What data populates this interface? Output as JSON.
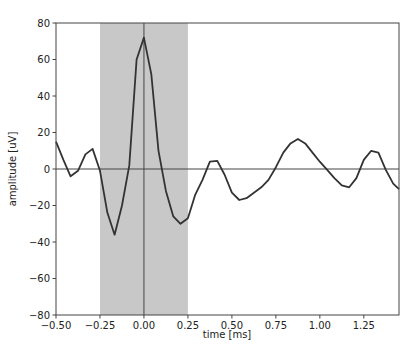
{
  "chart_data": {
    "type": "line",
    "title": "",
    "xlabel": "time [ms]",
    "ylabel": "amplitude [uV]",
    "xlim": [
      -0.5,
      1.45
    ],
    "ylim": [
      -80,
      80
    ],
    "xticks": [
      -0.5,
      -0.25,
      0.0,
      0.25,
      0.5,
      0.75,
      1.0,
      1.25
    ],
    "xtick_labels": [
      "−0.50",
      "−0.25",
      "0.00",
      "0.25",
      "0.50",
      "0.75",
      "1.00",
      "1.25"
    ],
    "yticks": [
      -80,
      -60,
      -40,
      -20,
      0,
      20,
      40,
      60,
      80
    ],
    "ytick_labels": [
      "−80",
      "−60",
      "−40",
      "−20",
      "0",
      "20",
      "40",
      "60",
      "80"
    ],
    "grid": false,
    "legend": null,
    "shaded_region": {
      "x_start": -0.25,
      "x_end": 0.25,
      "color": "#c8c8c8"
    },
    "reference_lines": {
      "horizontal_y": 0,
      "vertical_x": 0
    },
    "series": [
      {
        "name": "waveform",
        "color": "#333333",
        "x": [
          -0.5,
          -0.458,
          -0.417,
          -0.375,
          -0.333,
          -0.292,
          -0.25,
          -0.208,
          -0.167,
          -0.125,
          -0.083,
          -0.042,
          0.0,
          0.042,
          0.083,
          0.125,
          0.167,
          0.208,
          0.25,
          0.292,
          0.333,
          0.375,
          0.417,
          0.458,
          0.5,
          0.542,
          0.583,
          0.625,
          0.667,
          0.708,
          0.75,
          0.792,
          0.833,
          0.875,
          0.917,
          0.958,
          1.0,
          1.042,
          1.083,
          1.125,
          1.167,
          1.208,
          1.25,
          1.292,
          1.333,
          1.375,
          1.417,
          1.45
        ],
        "y": [
          15,
          5,
          -4,
          -1,
          8,
          11,
          -1,
          -24,
          -36,
          -20,
          2,
          60,
          72,
          52,
          10,
          -12,
          -26,
          -30,
          -27,
          -14,
          -6,
          4,
          4.5,
          -3,
          -13,
          -17,
          -16,
          -13,
          -10,
          -6,
          1,
          9,
          14,
          16.5,
          14,
          9,
          4,
          -0.5,
          -5,
          -9,
          -10,
          -5,
          5,
          10,
          9,
          -0.5,
          -8,
          -11
        ]
      }
    ]
  }
}
